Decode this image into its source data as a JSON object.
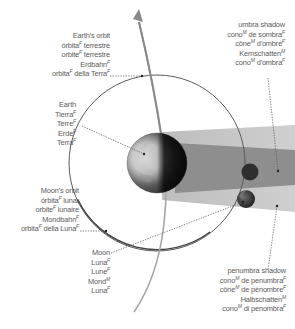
{
  "diagram": {
    "colors": {
      "background": "#ffffff",
      "label_text": "#5a5a5a",
      "penumbra": "#c4c4c4",
      "umbra": "#8f8f8f",
      "moon_orbit": "#555555",
      "earth_orbit": "#9a9a9a",
      "leader_line": "#555555",
      "moon_body": "#2e2e2e"
    },
    "labels": {
      "earth_orbit": {
        "lines": [
          {
            "text": "Earth's orbit",
            "gender": ""
          },
          {
            "text": "órbita",
            "gender": "F",
            "suffix": " terrestre"
          },
          {
            "text": "orbite",
            "gender": "F",
            "suffix": " terrestre"
          },
          {
            "text": "Erdbahn",
            "gender": "F",
            "suffix": ""
          },
          {
            "text": "orbita",
            "gender": "F",
            "suffix": " della Terra",
            "gender2": "F"
          }
        ]
      },
      "umbra_shadow": {
        "lines": [
          {
            "text": "umbra shadow",
            "gender": ""
          },
          {
            "text": "cono",
            "gender": "M",
            "suffix": " de sombra",
            "gender2": "F"
          },
          {
            "text": "cône",
            "gender": "M",
            "suffix": " d'ombre",
            "gender2": "F"
          },
          {
            "text": "Kernschatten",
            "gender": "M",
            "suffix": ""
          },
          {
            "text": "cono",
            "gender": "M",
            "suffix": " d'ombra",
            "gender2": "F"
          }
        ]
      },
      "earth": {
        "lines": [
          {
            "text": "Earth",
            "gender": ""
          },
          {
            "text": "Tierra",
            "gender": "F"
          },
          {
            "text": "Terre",
            "gender": "F"
          },
          {
            "text": "Erde",
            "gender": "F"
          },
          {
            "text": "Terra",
            "gender": "F"
          }
        ]
      },
      "moon_orbit": {
        "lines": [
          {
            "text": "Moon's orbit",
            "gender": ""
          },
          {
            "text": "órbita",
            "gender": "F",
            "suffix": " lunar"
          },
          {
            "text": "orbite",
            "gender": "F",
            "suffix": " lunaire"
          },
          {
            "text": "Mondbahn",
            "gender": "F",
            "suffix": ""
          },
          {
            "text": "orbita",
            "gender": "F",
            "suffix": " della Luna",
            "gender2": "F"
          }
        ]
      },
      "moon": {
        "lines": [
          {
            "text": "Moon",
            "gender": ""
          },
          {
            "text": "Luna",
            "gender": "F"
          },
          {
            "text": "Lune",
            "gender": "F"
          },
          {
            "text": "Mond",
            "gender": "M"
          },
          {
            "text": "Luna",
            "gender": "F"
          }
        ]
      },
      "penumbra_shadow": {
        "lines": [
          {
            "text": "penumbra shadow",
            "gender": ""
          },
          {
            "text": "cono",
            "gender": "M",
            "suffix": " de penumbra",
            "gender2": "F"
          },
          {
            "text": "cône",
            "gender": "M",
            "suffix": " de pénombre",
            "gender2": "F"
          },
          {
            "text": "Halbschatten",
            "gender": "M",
            "suffix": ""
          },
          {
            "text": "cono",
            "gender": "M",
            "suffix": " di penombra",
            "gender2": "F"
          }
        ]
      }
    },
    "icons": {
      "earth": "earth-globe-icon",
      "moon": "moon-icon",
      "arrow": "orbit-direction-arrow-icon"
    }
  }
}
